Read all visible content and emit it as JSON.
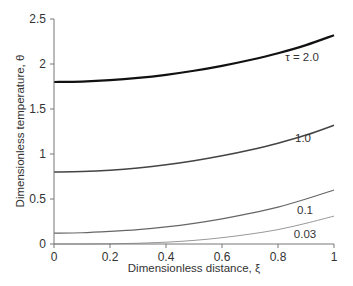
{
  "chart_data": {
    "type": "line",
    "title": "",
    "xlabel": "Dimensionless distance, ξ",
    "ylabel": "Dimensionless temperature, θ",
    "xlim": [
      0,
      1
    ],
    "ylim": [
      0,
      2.5
    ],
    "x_ticks": [
      "0",
      "0.2",
      "0.4",
      "0.6",
      "0.8",
      "1"
    ],
    "y_ticks": [
      "0",
      "0.5",
      "1",
      "1.5",
      "2",
      "2.5"
    ],
    "grid": false,
    "legend": "inline labels at right end of curves",
    "x": [
      0,
      0.1,
      0.2,
      0.3,
      0.4,
      0.5,
      0.6,
      0.7,
      0.8,
      0.9,
      1.0
    ],
    "series": [
      {
        "name": "τ = 2.0",
        "label": "τ = 2.0",
        "color": "#111111",
        "width": 2.2,
        "values": [
          1.8,
          1.805,
          1.82,
          1.845,
          1.88,
          1.925,
          1.98,
          2.045,
          2.12,
          2.21,
          2.32
        ]
      },
      {
        "name": "1.0",
        "label": "1.0",
        "color": "#444444",
        "width": 1.6,
        "values": [
          0.8,
          0.805,
          0.82,
          0.845,
          0.88,
          0.925,
          0.98,
          1.045,
          1.12,
          1.21,
          1.32
        ]
      },
      {
        "name": "0.1",
        "label": "0.1",
        "color": "#666666",
        "width": 1.2,
        "values": [
          0.12,
          0.125,
          0.14,
          0.16,
          0.19,
          0.23,
          0.28,
          0.34,
          0.41,
          0.5,
          0.6
        ]
      },
      {
        "name": "0.03",
        "label": "0.03",
        "color": "#999999",
        "width": 1.0,
        "values": [
          0.0,
          0.0,
          0.002,
          0.008,
          0.02,
          0.04,
          0.07,
          0.11,
          0.16,
          0.23,
          0.31
        ]
      }
    ]
  }
}
